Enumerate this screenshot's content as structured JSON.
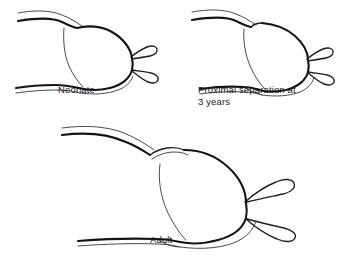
{
  "figure": {
    "background_color": "#ffffff",
    "ink_color": "#141414",
    "style": "line-drawing",
    "panel_count": 3
  },
  "panels": [
    {
      "id": "neonate",
      "caption": "Neonate",
      "icon_name": "anatomical-outline-neonate"
    },
    {
      "id": "three-years",
      "caption": "Proximal separation at\n3 years",
      "icon_name": "anatomical-outline-three-years"
    },
    {
      "id": "adult",
      "caption": "Adult",
      "icon_name": "anatomical-outline-adult"
    }
  ]
}
